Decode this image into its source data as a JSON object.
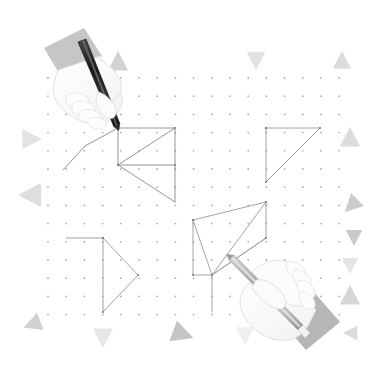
{
  "illustration": {
    "title": "Hands drawing geometric shapes on a dot grid",
    "background_color": "#ffffff",
    "width": 379,
    "height": 378
  },
  "dot_grid": {
    "name": "dot-grid",
    "origin_x": 48,
    "origin_y": 78,
    "spacing": 18.2,
    "cols": 17,
    "rows": 14,
    "dot_radius": 0.9,
    "dot_color": "#b9a9a9"
  },
  "shapes": [
    {
      "name": "square-with-diagonal-top-left",
      "stroke": "#8a8a8a",
      "stroke_width": 0.9,
      "polyline": "118,128 175,128 175,165 118,165 118,128",
      "extra_lines": [
        "118,165 175,128",
        "118,128 85,146",
        "85,146 63,170",
        "118,165 175,202",
        "175,165 175,202"
      ]
    },
    {
      "name": "right-triangle-top-right",
      "stroke": "#9a9a9a",
      "stroke_width": 0.9,
      "polyline": "266,128 320,128 266,182 266,128"
    },
    {
      "name": "right-pointing-triangle-bottom-left",
      "stroke": "#9a9a9a",
      "stroke_width": 0.9,
      "polyline": "103,238 103,312 138,275 103,238",
      "extra_lines": [
        "103,238 66,238"
      ]
    },
    {
      "name": "compound-polygon-bottom-center",
      "stroke": "#9a9a9a",
      "stroke_width": 0.9,
      "polyline": "193,220 266,202 266,238 212,275 193,275 193,220",
      "extra_lines": [
        "193,220 212,275",
        "266,202 212,275",
        "266,238 212,275",
        "212,275 212,312"
      ]
    }
  ],
  "hands": [
    {
      "name": "hand-top-left-holding-pencil",
      "position": "top-left",
      "sleeve_color": "#c9c9c9",
      "skin_color": "#fbfbfb",
      "outline_color": "#d4d4d4",
      "pencil_color": "#2b2b2b",
      "pencil_tip_x": 118,
      "pencil_tip_y": 128
    },
    {
      "name": "hand-bottom-right-holding-pencil",
      "position": "bottom-right",
      "sleeve_color": "#b5b5b5",
      "skin_color": "#fbfbfb",
      "outline_color": "#d0d0d0",
      "pencil_color": "#a8a8a8",
      "pencil_tip_x": 230,
      "pencil_tip_y": 262
    }
  ],
  "decor_triangles": [
    {
      "name": "triangle-top-left-up",
      "x": 118,
      "y": 62,
      "size": 11,
      "rotation": 0,
      "color": "#d0d0d0",
      "opacity": 0.95
    },
    {
      "name": "triangle-top-mid-down",
      "x": 256,
      "y": 60,
      "size": 10,
      "rotation": 180,
      "color": "#dedede",
      "opacity": 0.9
    },
    {
      "name": "triangle-top-right-up",
      "x": 342,
      "y": 61,
      "size": 10,
      "rotation": 0,
      "color": "#d8d8d8",
      "opacity": 0.9
    },
    {
      "name": "triangle-left-upper-right",
      "x": 31,
      "y": 139,
      "size": 11,
      "rotation": 90,
      "color": "#e0e0e0",
      "opacity": 0.9
    },
    {
      "name": "triangle-left-lower-left",
      "x": 31,
      "y": 195,
      "size": 13,
      "rotation": 270,
      "color": "#dcdcdc",
      "opacity": 0.95
    },
    {
      "name": "triangle-right-upper-up",
      "x": 350,
      "y": 138,
      "size": 11,
      "rotation": 0,
      "color": "#d8d8d8",
      "opacity": 0.9
    },
    {
      "name": "triangle-right-mid-left",
      "x": 352,
      "y": 205,
      "size": 10,
      "rotation": 225,
      "color": "#c9c9c9",
      "opacity": 0.95
    },
    {
      "name": "triangle-right-down-a",
      "x": 354,
      "y": 237,
      "size": 9,
      "rotation": 180,
      "color": "#c4c4c4",
      "opacity": 0.9
    },
    {
      "name": "triangle-right-down-b",
      "x": 350,
      "y": 265,
      "size": 9,
      "rotation": 180,
      "color": "#e2e2e2",
      "opacity": 0.9
    },
    {
      "name": "triangle-right-lower-up",
      "x": 350,
      "y": 296,
      "size": 11,
      "rotation": 0,
      "color": "#d2d2d2",
      "opacity": 0.9
    },
    {
      "name": "triangle-bottom-left-left",
      "x": 33,
      "y": 324,
      "size": 10,
      "rotation": 250,
      "color": "#cfcfcf",
      "opacity": 0.95
    },
    {
      "name": "triangle-bottom-a-down",
      "x": 103,
      "y": 337,
      "size": 11,
      "rotation": 180,
      "color": "#e4e4e4",
      "opacity": 0.9
    },
    {
      "name": "triangle-bottom-b-right",
      "x": 182,
      "y": 334,
      "size": 12,
      "rotation": 110,
      "color": "#c2c2c2",
      "opacity": 0.95
    },
    {
      "name": "triangle-bottom-c-down",
      "x": 245,
      "y": 335,
      "size": 10,
      "rotation": 180,
      "color": "#ededed",
      "opacity": 0.9
    },
    {
      "name": "triangle-bottom-right-left",
      "x": 351,
      "y": 333,
      "size": 8,
      "rotation": 270,
      "color": "#d6d6d6",
      "opacity": 0.9
    }
  ]
}
